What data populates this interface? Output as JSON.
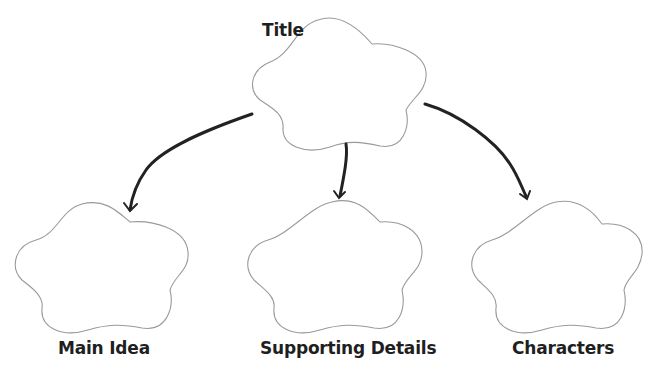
{
  "diagram": {
    "type": "graphic-organizer",
    "root": {
      "label": "Title"
    },
    "children": [
      {
        "label": "Main Idea"
      },
      {
        "label": "Supporting Details"
      },
      {
        "label": "Characters"
      }
    ],
    "colors": {
      "outline": "#9a9a9a",
      "arrow": "#222222",
      "text": "#1f1f1f",
      "background": "#ffffff"
    }
  }
}
